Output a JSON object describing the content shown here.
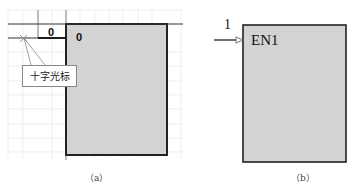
{
  "panel_a": {
    "caption": "（a）",
    "row_label": "0",
    "cell_label": "0",
    "callout_text": "十字光标",
    "cursor_icon": "crosshair-icon",
    "block_fill": "#d3d3d3",
    "grid_color": "#e6e6e6"
  },
  "panel_b": {
    "caption": "（b）",
    "input_number": "1",
    "block_label": "EN1",
    "input_icon": "arrow-right-icon",
    "block_fill": "#d3d3d3"
  }
}
